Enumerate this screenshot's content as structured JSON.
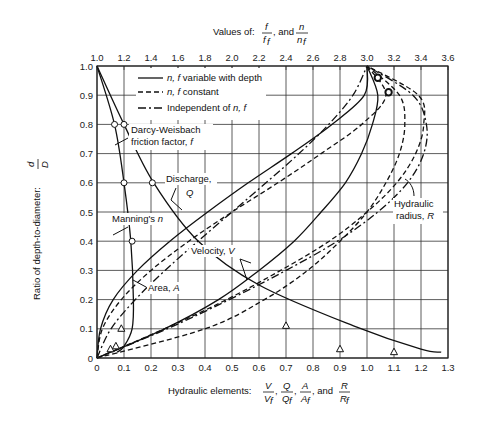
{
  "chart_data": {
    "type": "line",
    "title": "",
    "top_axis": {
      "label_prefix": "Values of:",
      "label_frac1_num": "f",
      "label_frac1_den": "f",
      "label_frac1_den_sub": "f",
      "label_and": ", and",
      "label_frac2_num": "n",
      "label_frac2_den": "n",
      "label_frac2_den_sub": "f",
      "ticks": [
        "1.0",
        "1.2",
        "1.4",
        "1.6",
        "1.8",
        "2.0",
        "2.2",
        "2.4",
        "2.6",
        "2.8",
        "3.0",
        "3.2",
        "3.4",
        "3.6"
      ],
      "range": [
        1.0,
        3.6
      ]
    },
    "xlabel": {
      "prefix": "Hydraulic elements:",
      "fracs": [
        {
          "num": "V",
          "den": "V",
          "sub": "f"
        },
        {
          "num": "Q",
          "den": "Q",
          "sub": "f"
        },
        {
          "num": "A",
          "den": "A",
          "sub": "f"
        },
        {
          "num": "R",
          "den": "R",
          "sub": "f"
        }
      ],
      "and": ", and"
    },
    "ylabel": {
      "prefix": "Ratio of depth-to-diameter:",
      "num": "d",
      "den": "D"
    },
    "x_ticks": [
      "0",
      "0.1",
      "0.2",
      "0.3",
      "0.4",
      "0.5",
      "0.6",
      "0.7",
      "0.8",
      "0.9",
      "1.0",
      "1.1",
      "1.2",
      "1.3"
    ],
    "y_ticks": [
      "0",
      "0.1",
      "0.2",
      "0.3",
      "0.4",
      "0.5",
      "0.6",
      "0.7",
      "0.8",
      "0.9",
      "1.0"
    ],
    "xlim": [
      0,
      1.3
    ],
    "ylim": [
      0,
      1.0
    ],
    "grid": true,
    "legend": {
      "position": "upper-left-inside",
      "entries": [
        {
          "style": "solid",
          "label_it": "n, f",
          "label": " variable with depth"
        },
        {
          "style": "dashed",
          "label_it": "n, f",
          "label": " constant"
        },
        {
          "style": "dash-dot",
          "label_pre": "Independent of ",
          "label_it": "n, f"
        }
      ]
    },
    "annotations": {
      "darcy": [
        "Darcy-Weisbach",
        "friction factor, "
      ],
      "darcy_it": "f",
      "manning": "Manning's ",
      "manning_it": "n",
      "discharge": "Discharge,",
      "discharge_it": "Q",
      "velocity": "Velocity, ",
      "velocity_it": "V",
      "area": "Area, ",
      "area_it": "A",
      "hyd": "Hydraulic",
      "radius": "radius, ",
      "radius_it": "R"
    },
    "series": [
      {
        "name": "Area A (all)",
        "style": "dash-dot",
        "axis": "bottom",
        "x": [
          0,
          0.052,
          0.142,
          0.252,
          0.374,
          0.5,
          0.626,
          0.748,
          0.858,
          0.948,
          1.0
        ],
        "y": [
          0,
          0.1,
          0.2,
          0.3,
          0.4,
          0.5,
          0.6,
          0.7,
          0.8,
          0.9,
          1.0
        ]
      },
      {
        "name": "Velocity V (n,f constant)",
        "style": "dashed",
        "axis": "bottom",
        "x": [
          0,
          0.4,
          0.62,
          0.78,
          0.9,
          1.0,
          1.07,
          1.12,
          1.14,
          1.12,
          1.0
        ],
        "y": [
          0,
          0.1,
          0.2,
          0.3,
          0.4,
          0.5,
          0.6,
          0.7,
          0.8,
          0.9,
          1.0
        ]
      },
      {
        "name": "Velocity V (n,f variable)",
        "style": "solid",
        "axis": "bottom",
        "x": [
          0,
          0.25,
          0.45,
          0.6,
          0.73,
          0.83,
          0.92,
          0.98,
          1.02,
          1.04,
          1.0
        ],
        "y": [
          0,
          0.1,
          0.2,
          0.3,
          0.4,
          0.5,
          0.6,
          0.7,
          0.8,
          0.9,
          1.0
        ]
      },
      {
        "name": "Discharge Q (n,f constant)",
        "style": "dashed",
        "axis": "bottom",
        "x": [
          0,
          0.02,
          0.09,
          0.2,
          0.34,
          0.5,
          0.67,
          0.83,
          0.98,
          1.07,
          1.0
        ],
        "y": [
          0,
          0.1,
          0.2,
          0.3,
          0.4,
          0.5,
          0.6,
          0.7,
          0.8,
          0.9,
          1.0
        ]
      },
      {
        "name": "Discharge Q (n,f variable)",
        "style": "solid",
        "axis": "bottom",
        "x": [
          0,
          0.013,
          0.06,
          0.15,
          0.27,
          0.41,
          0.56,
          0.72,
          0.87,
          0.99,
          1.0
        ],
        "y": [
          0,
          0.1,
          0.2,
          0.3,
          0.4,
          0.5,
          0.6,
          0.7,
          0.8,
          0.9,
          1.0
        ]
      },
      {
        "name": "Hydraulic radius R (constant)",
        "style": "dashed",
        "axis": "bottom",
        "x": [
          0,
          0.25,
          0.48,
          0.68,
          0.86,
          1.0,
          1.11,
          1.18,
          1.21,
          1.19,
          1.0
        ],
        "y": [
          0,
          0.1,
          0.2,
          0.3,
          0.4,
          0.5,
          0.6,
          0.7,
          0.8,
          0.9,
          1.0
        ]
      },
      {
        "name": "Hydraulic radius R (independent)",
        "style": "dash-dot",
        "axis": "bottom",
        "x": [
          0,
          0.26,
          0.49,
          0.7,
          0.89,
          1.04,
          1.15,
          1.21,
          1.22,
          1.17,
          1.0
        ],
        "y": [
          0,
          0.1,
          0.2,
          0.3,
          0.4,
          0.5,
          0.6,
          0.7,
          0.8,
          0.9,
          1.0
        ]
      },
      {
        "name": "Darcy-Weisbach f/f_f",
        "style": "solid",
        "axis": "top",
        "x": [
          1.0,
          1.2,
          1.42,
          1.75,
          2.2,
          2.9,
          3.4,
          3.55
        ],
        "y": [
          1.0,
          0.8,
          0.6,
          0.4,
          0.25,
          0.11,
          0.03,
          0.02
        ]
      },
      {
        "name": "Manning n/n_f",
        "style": "solid",
        "axis": "top",
        "x": [
          1.0,
          1.13,
          1.2,
          1.25,
          1.27,
          1.26,
          1.2,
          1.15
        ],
        "y": [
          1.0,
          0.8,
          0.6,
          0.4,
          0.2,
          0.1,
          0.04,
          0.02
        ]
      }
    ],
    "markers": {
      "circles_top_axis": [
        [
          1.13,
          0.8
        ],
        [
          1.2,
          0.8
        ],
        [
          1.2,
          0.6
        ],
        [
          1.41,
          0.6
        ],
        [
          1.26,
          0.4
        ]
      ],
      "triangles": [
        [
          0.09,
          0.1
        ],
        [
          0.07,
          0.04
        ],
        [
          0.05,
          0.03
        ],
        [
          0.7,
          0.11
        ],
        [
          0.9,
          0.03
        ],
        [
          1.1,
          0.02
        ]
      ],
      "bold_circles": [
        [
          1.04,
          0.96
        ],
        [
          1.08,
          0.91
        ]
      ]
    }
  }
}
